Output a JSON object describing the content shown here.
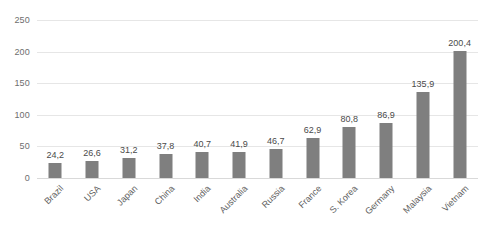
{
  "chart_data": {
    "type": "bar",
    "title": "",
    "xlabel": "",
    "ylabel": "",
    "ylim": [
      0,
      250
    ],
    "yticks": [
      0,
      50,
      100,
      150,
      200,
      250
    ],
    "ytick_labels": [
      "0",
      "50",
      "100",
      "150",
      "200",
      "250"
    ],
    "grid": true,
    "legend": false,
    "decimal_separator": ",",
    "bar_color": "#7f7f7f",
    "gridline_color": "#e6e6e6",
    "categories": [
      "Brazil",
      "USA",
      "Japan",
      "China",
      "India",
      "Australia",
      "Russia",
      "France",
      "S. Korea",
      "Germany",
      "Malaysia",
      "Vietnam"
    ],
    "values": [
      24.2,
      26.6,
      31.2,
      37.8,
      40.7,
      41.9,
      46.7,
      62.9,
      80.8,
      86.9,
      135.9,
      200.4
    ],
    "value_labels": [
      "24,2",
      "26,6",
      "31,2",
      "37,8",
      "40,7",
      "41,9",
      "46,7",
      "62,9",
      "80,8",
      "86,9",
      "135,9",
      "200,4"
    ],
    "bars": [
      {
        "label": "Brazil",
        "value": 24.2,
        "value_label": "24,2"
      },
      {
        "label": "USA",
        "value": 26.6,
        "value_label": "26,6"
      },
      {
        "label": "Japan",
        "value": 31.2,
        "value_label": "31,2"
      },
      {
        "label": "China",
        "value": 37.8,
        "value_label": "37,8"
      },
      {
        "label": "India",
        "value": 40.7,
        "value_label": "40,7"
      },
      {
        "label": "Australia",
        "value": 41.9,
        "value_label": "41,9"
      },
      {
        "label": "Russia",
        "value": 46.7,
        "value_label": "46,7"
      },
      {
        "label": "France",
        "value": 62.9,
        "value_label": "62,9"
      },
      {
        "label": "S. Korea",
        "value": 80.8,
        "value_label": "80,8"
      },
      {
        "label": "Germany",
        "value": 86.9,
        "value_label": "86,9"
      },
      {
        "label": "Malaysia",
        "value": 135.9,
        "value_label": "135,9"
      },
      {
        "label": "Vietnam",
        "value": 200.4,
        "value_label": "200,4"
      }
    ]
  }
}
